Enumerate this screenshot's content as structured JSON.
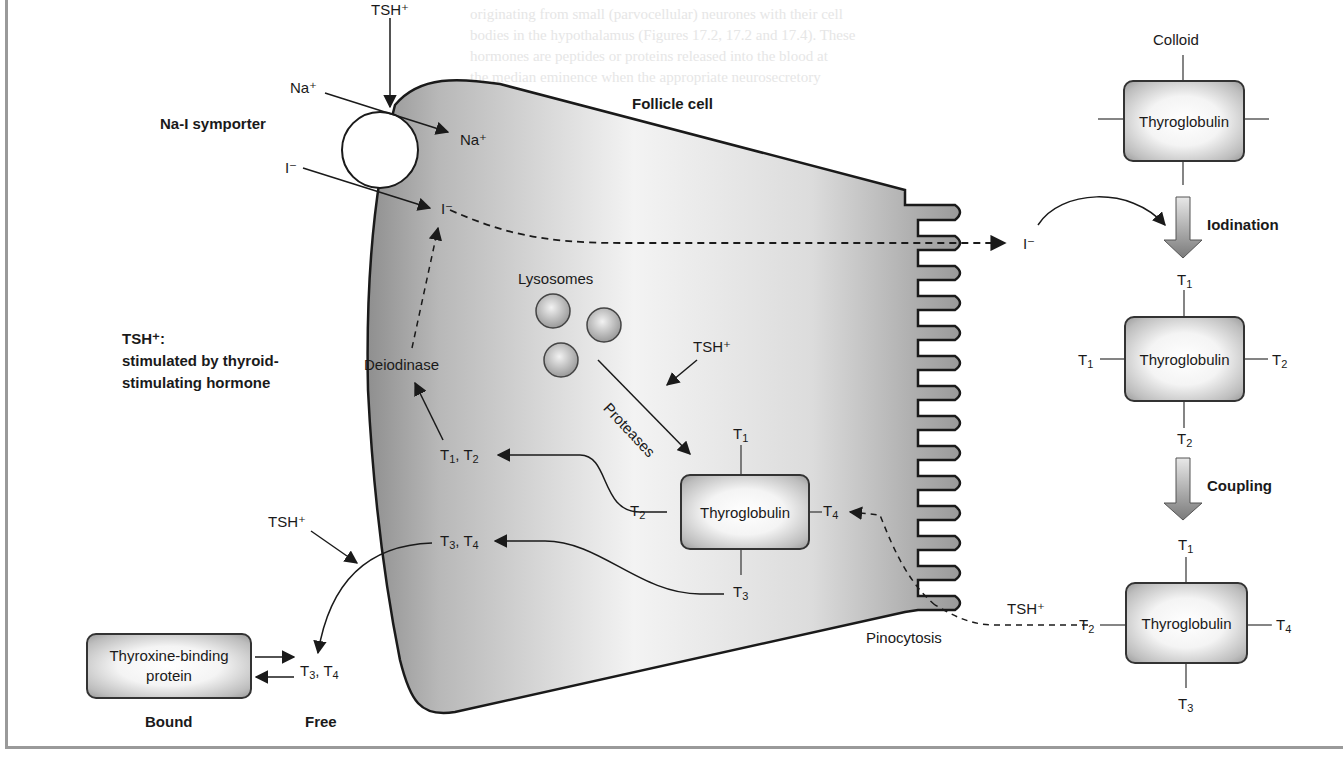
{
  "figure": {
    "cell_label": "Follicle cell",
    "colloid_label": "Colloid",
    "symporter_label": "Na-I symporter",
    "legend": {
      "title": "TSH⁺:",
      "line1": "stimulated by thyroid-",
      "line2": "stimulating hormone"
    },
    "ions": {
      "sodium_out": "Na⁺",
      "sodium_in": "Na⁺",
      "iodide_out": "I⁻",
      "iodide_in": "I⁻",
      "iodide_colloid": "I⁻"
    },
    "tsh": {
      "symporter": "TSH⁺",
      "protease": "TSH⁺",
      "secretion": "TSH⁺",
      "pinocytosis": "TSH⁺"
    },
    "labels": {
      "lysosomes": "Lysosomes",
      "proteases": "Proteases",
      "deiodinase": "Deiodinase",
      "pinocytosis": "Pinocytosis",
      "iodination": "Iodination",
      "coupling": "Coupling",
      "thyroglobulin": "Thyroglobulin",
      "tbp_line1": "Thyroxine-binding",
      "tbp_line2": "protein",
      "bound": "Bound",
      "free": "Free"
    },
    "hormone_groups": {
      "t1_t2": {
        "a": "T",
        "a_sub": "1",
        "b": "T",
        "b_sub": "2"
      },
      "t3_t4": {
        "a": "T",
        "a_sub": "3",
        "b": "T",
        "b_sub": "4"
      },
      "free_t3_t4": {
        "a": "T",
        "a_sub": "3",
        "b": "T",
        "b_sub": "4"
      }
    },
    "thyroglobulin_boxes": [
      {
        "id": "colloid-plain",
        "top": "",
        "left": "",
        "right": "",
        "bottom": ""
      },
      {
        "id": "iodinated",
        "top": "1",
        "left": "1",
        "right": "2",
        "bottom": "2"
      },
      {
        "id": "coupled",
        "top": "1",
        "left": "2",
        "right": "4",
        "bottom": "3"
      },
      {
        "id": "intracellular",
        "top": "1",
        "left": "2",
        "right": "4",
        "bottom": "3"
      }
    ],
    "colors": {
      "cell_fill_dark": "#9e9e9e",
      "cell_fill_light": "#f2f2f2",
      "stroke": "#1a1a1a",
      "frame": "#9a9a9a"
    }
  }
}
